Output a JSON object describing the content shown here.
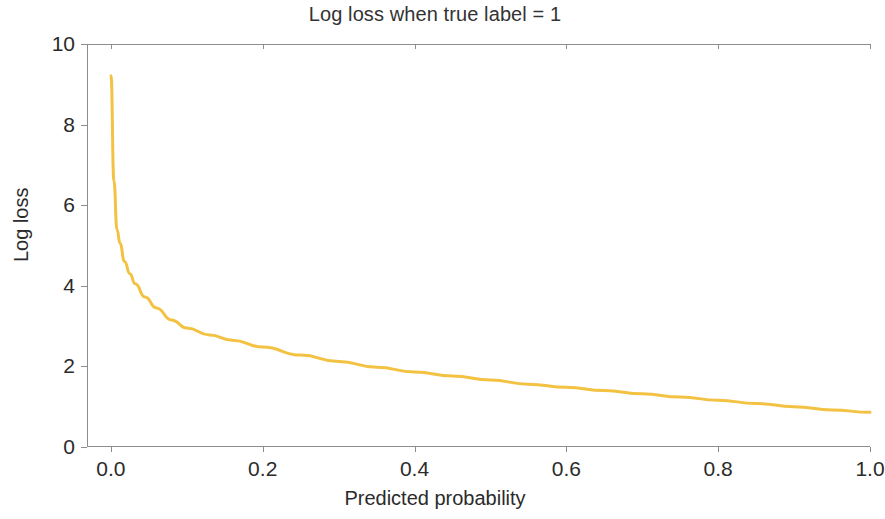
{
  "chart_data": {
    "type": "line",
    "title": "Log loss when true label = 1",
    "xlabel": "Predicted probability",
    "ylabel": "Log loss",
    "xlim": [
      -0.0315,
      1.0
    ],
    "ylim": [
      0.0,
      10.0
    ],
    "grid": false,
    "legend": null,
    "line_color": "#F3C243",
    "line_width": 3,
    "xticks": [
      "0.0",
      "0.2",
      "0.4",
      "0.6",
      "0.8",
      "1.0"
    ],
    "xtick_values": [
      0.0,
      0.2,
      0.4,
      0.6,
      0.8,
      1.0
    ],
    "yticks": [
      "0",
      "2",
      "4",
      "6",
      "8",
      "10"
    ],
    "ytick_values": [
      0,
      2,
      4,
      6,
      8,
      10
    ],
    "series": [
      {
        "name": "-log(p)",
        "x": [
          0.0001,
          0.0015,
          0.003,
          0.005,
          0.0075,
          0.01,
          0.015,
          0.02,
          0.025,
          0.03,
          0.04,
          0.05,
          0.06,
          0.07,
          0.08,
          0.09,
          0.1,
          0.12,
          0.14,
          0.16,
          0.18,
          0.2,
          0.24,
          0.28,
          0.32,
          0.36,
          0.4,
          0.44,
          0.48,
          0.52,
          0.56,
          0.6,
          0.64,
          0.68,
          0.72,
          0.76,
          0.8,
          0.84,
          0.88,
          0.92,
          0.96,
          1.0
        ],
        "y": [
          9.21,
          6.5,
          5.81,
          5.3,
          4.89,
          4.61,
          4.2,
          3.91,
          3.69,
          3.51,
          3.22,
          3.0,
          2.81,
          2.66,
          2.53,
          2.41,
          2.3,
          2.12,
          1.97,
          1.83,
          1.71,
          1.61,
          1.43,
          1.27,
          1.14,
          1.02,
          0.92,
          0.82,
          0.73,
          0.65,
          0.58,
          0.51,
          0.45,
          0.39,
          0.33,
          0.27,
          0.22,
          0.17,
          0.13,
          0.08,
          0.04,
          0.0
        ],
        "y_rendered_note": "curve drawn clipped/offset so rendered minimum is ~0.85 at p=1.0"
      }
    ],
    "rendered_points": [
      {
        "x": 0.0001,
        "y": 9.21
      },
      {
        "x": 0.004,
        "y": 6.6
      },
      {
        "x": 0.008,
        "y": 5.4
      },
      {
        "x": 0.012,
        "y": 5.05
      },
      {
        "x": 0.018,
        "y": 4.6
      },
      {
        "x": 0.025,
        "y": 4.3
      },
      {
        "x": 0.032,
        "y": 4.05
      },
      {
        "x": 0.045,
        "y": 3.72
      },
      {
        "x": 0.06,
        "y": 3.45
      },
      {
        "x": 0.08,
        "y": 3.15
      },
      {
        "x": 0.1,
        "y": 2.95
      },
      {
        "x": 0.13,
        "y": 2.78
      },
      {
        "x": 0.16,
        "y": 2.65
      },
      {
        "x": 0.2,
        "y": 2.48
      },
      {
        "x": 0.25,
        "y": 2.28
      },
      {
        "x": 0.3,
        "y": 2.12
      },
      {
        "x": 0.35,
        "y": 1.98
      },
      {
        "x": 0.4,
        "y": 1.86
      },
      {
        "x": 0.45,
        "y": 1.76
      },
      {
        "x": 0.5,
        "y": 1.66
      },
      {
        "x": 0.55,
        "y": 1.56
      },
      {
        "x": 0.6,
        "y": 1.48
      },
      {
        "x": 0.65,
        "y": 1.4
      },
      {
        "x": 0.7,
        "y": 1.32
      },
      {
        "x": 0.75,
        "y": 1.24
      },
      {
        "x": 0.8,
        "y": 1.16
      },
      {
        "x": 0.85,
        "y": 1.08
      },
      {
        "x": 0.9,
        "y": 1.0
      },
      {
        "x": 0.95,
        "y": 0.92
      },
      {
        "x": 1.0,
        "y": 0.86
      }
    ]
  }
}
